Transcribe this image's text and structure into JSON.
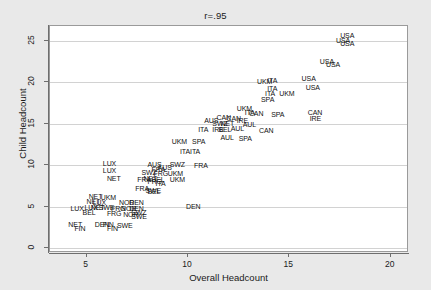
{
  "chart_data": {
    "type": "scatter",
    "title": "r=.95",
    "xlabel": "Overall Headcount",
    "ylabel": "Child Headcount",
    "xlim": [
      3.2,
      20.9
    ],
    "ylim": [
      -0.6,
      26.8
    ],
    "xticks": [
      5,
      10,
      15,
      20
    ],
    "yticks": [
      0,
      5,
      10,
      15,
      20,
      25
    ],
    "grid": "horizontal",
    "legend": "none",
    "marker_style": "text-label",
    "points": [
      {
        "label": "USA",
        "x": 17.9,
        "y": 25.6
      },
      {
        "label": "USA",
        "x": 17.7,
        "y": 25.0
      },
      {
        "label": "USA",
        "x": 17.9,
        "y": 24.7
      },
      {
        "label": "USA",
        "x": 16.9,
        "y": 22.5
      },
      {
        "label": "USA",
        "x": 17.2,
        "y": 22.1
      },
      {
        "label": "USA",
        "x": 16.0,
        "y": 20.5
      },
      {
        "label": "USA",
        "x": 16.2,
        "y": 19.4
      },
      {
        "label": "UKM",
        "x": 13.8,
        "y": 20.1
      },
      {
        "label": "ITA",
        "x": 14.3,
        "y": 20.2
      },
      {
        "label": "ITA",
        "x": 14.3,
        "y": 19.2
      },
      {
        "label": "ITA",
        "x": 14.2,
        "y": 18.6
      },
      {
        "label": "UKM",
        "x": 14.9,
        "y": 18.6
      },
      {
        "label": "SPA",
        "x": 14.0,
        "y": 17.9
      },
      {
        "label": "UKM",
        "x": 12.8,
        "y": 16.9
      },
      {
        "label": "ITA",
        "x": 13.2,
        "y": 16.3
      },
      {
        "label": "CAN",
        "x": 13.4,
        "y": 16.2
      },
      {
        "label": "SPA",
        "x": 14.5,
        "y": 16.1
      },
      {
        "label": "CAN",
        "x": 16.3,
        "y": 16.3
      },
      {
        "label": "IRE",
        "x": 16.4,
        "y": 15.6
      },
      {
        "label": "AUS",
        "x": 11.2,
        "y": 15.4
      },
      {
        "label": "CAN",
        "x": 11.8,
        "y": 15.7
      },
      {
        "label": "CAN",
        "x": 12.3,
        "y": 15.6
      },
      {
        "label": "IRE",
        "x": 12.8,
        "y": 15.4
      },
      {
        "label": "SWZ",
        "x": 11.6,
        "y": 15.0
      },
      {
        "label": "NET",
        "x": 12.0,
        "y": 15.0
      },
      {
        "label": "AUL",
        "x": 13.1,
        "y": 14.9
      },
      {
        "label": "ITA",
        "x": 10.9,
        "y": 14.3
      },
      {
        "label": "IRE",
        "x": 11.6,
        "y": 14.3
      },
      {
        "label": "BEL",
        "x": 11.9,
        "y": 14.3
      },
      {
        "label": "AUL",
        "x": 12.5,
        "y": 14.4
      },
      {
        "label": "CAN",
        "x": 13.9,
        "y": 14.2
      },
      {
        "label": "AUL",
        "x": 12.0,
        "y": 13.3
      },
      {
        "label": "SPA",
        "x": 12.9,
        "y": 13.2
      },
      {
        "label": "UKM",
        "x": 9.6,
        "y": 12.9
      },
      {
        "label": "SPA",
        "x": 10.6,
        "y": 12.8
      },
      {
        "label": "ITA",
        "x": 10.0,
        "y": 11.7
      },
      {
        "label": "ITA",
        "x": 10.5,
        "y": 11.6
      },
      {
        "label": "LUX",
        "x": 6.2,
        "y": 10.2
      },
      {
        "label": "AUS",
        "x": 8.4,
        "y": 10.1
      },
      {
        "label": "SWZ",
        "x": 9.5,
        "y": 10.1
      },
      {
        "label": "FRA",
        "x": 10.7,
        "y": 10.0
      },
      {
        "label": "LUX",
        "x": 6.2,
        "y": 9.4
      },
      {
        "label": "FRA",
        "x": 8.6,
        "y": 9.5
      },
      {
        "label": "AUS",
        "x": 8.9,
        "y": 9.7
      },
      {
        "label": "SWZ",
        "x": 8.1,
        "y": 9.1
      },
      {
        "label": "FRG",
        "x": 8.7,
        "y": 9.0
      },
      {
        "label": "UKM",
        "x": 9.4,
        "y": 9.0
      },
      {
        "label": "NET",
        "x": 6.4,
        "y": 8.4
      },
      {
        "label": "FRA",
        "x": 7.9,
        "y": 8.3
      },
      {
        "label": "NET",
        "x": 8.2,
        "y": 8.4
      },
      {
        "label": "BEL",
        "x": 8.6,
        "y": 8.3
      },
      {
        "label": "UKM",
        "x": 9.5,
        "y": 8.3
      },
      {
        "label": "FRG",
        "x": 8.4,
        "y": 8.0
      },
      {
        "label": "ITA",
        "x": 8.8,
        "y": 7.8
      },
      {
        "label": "FRA",
        "x": 7.8,
        "y": 7.2
      },
      {
        "label": "SWE",
        "x": 8.3,
        "y": 7.0
      },
      {
        "label": "BEL",
        "x": 8.4,
        "y": 6.8
      },
      {
        "label": "NET",
        "x": 5.5,
        "y": 6.2
      },
      {
        "label": "UKM",
        "x": 6.1,
        "y": 6.1
      },
      {
        "label": "NET",
        "x": 5.4,
        "y": 5.6
      },
      {
        "label": "LUX",
        "x": 5.7,
        "y": 5.5
      },
      {
        "label": "NOR",
        "x": 7.0,
        "y": 5.5
      },
      {
        "label": "DEN",
        "x": 7.5,
        "y": 5.5
      },
      {
        "label": "DEN",
        "x": 10.3,
        "y": 5.0
      },
      {
        "label": "LUX",
        "x": 4.6,
        "y": 4.8
      },
      {
        "label": "LUX",
        "x": 5.3,
        "y": 4.9
      },
      {
        "label": "NET",
        "x": 5.6,
        "y": 4.9
      },
      {
        "label": "SWE",
        "x": 6.0,
        "y": 4.9
      },
      {
        "label": "FRG",
        "x": 6.6,
        "y": 4.8
      },
      {
        "label": "NOR",
        "x": 7.1,
        "y": 4.8
      },
      {
        "label": "DEN",
        "x": 7.5,
        "y": 4.8
      },
      {
        "label": "BEL",
        "x": 5.2,
        "y": 4.3
      },
      {
        "label": "FRG",
        "x": 6.4,
        "y": 4.2
      },
      {
        "label": "SWZ",
        "x": 7.6,
        "y": 4.3
      },
      {
        "label": "NOR",
        "x": 7.2,
        "y": 4.1
      },
      {
        "label": "SWE",
        "x": 7.6,
        "y": 3.8
      },
      {
        "label": "NET",
        "x": 4.5,
        "y": 2.8
      },
      {
        "label": "DEN",
        "x": 5.8,
        "y": 2.8
      },
      {
        "label": "FIN",
        "x": 6.2,
        "y": 2.8
      },
      {
        "label": "SWE",
        "x": 6.9,
        "y": 2.7
      },
      {
        "label": "FIN",
        "x": 4.8,
        "y": 2.3
      },
      {
        "label": "FIN",
        "x": 6.4,
        "y": 2.3
      }
    ]
  },
  "axes": {
    "x_tick_labels": [
      "5",
      "10",
      "15",
      "20"
    ],
    "y_tick_labels": [
      "0",
      "5",
      "10",
      "15",
      "20",
      "25"
    ]
  }
}
